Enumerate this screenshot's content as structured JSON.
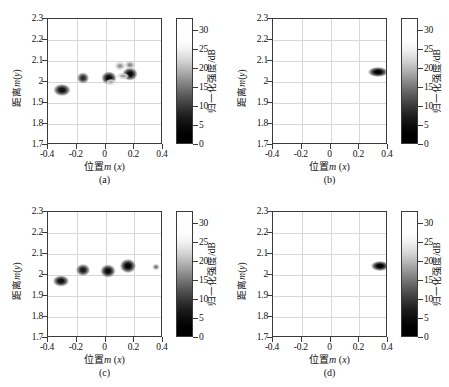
{
  "figure": {
    "panels": [
      {
        "tag": "(a)",
        "xlabel_cn": "位置",
        "xlabel_m": "m",
        "xlabel_var": "(x)",
        "ylabel": "距离m(y)",
        "cbar_label": "归一化强度/dB"
      },
      {
        "tag": "(b)",
        "xlabel_cn": "位置",
        "xlabel_m": "m",
        "xlabel_var": "(x)",
        "ylabel": "距离m(y)",
        "cbar_label": "归一化强度/dB"
      },
      {
        "tag": "(c)",
        "xlabel_cn": "位置",
        "xlabel_m": "m",
        "xlabel_var": "(x)",
        "ylabel": "距离m(y)",
        "cbar_label": "归一化强度/dB"
      },
      {
        "tag": "(d)",
        "xlabel_cn": "位置",
        "xlabel_m": "m",
        "xlabel_var": "(x)",
        "ylabel": "距离m(y)",
        "cbar_label": "归一化强度/dB"
      }
    ]
  },
  "chart_data": [
    {
      "type": "heatmap",
      "title": "(a)",
      "xlabel": "位置m (x)",
      "ylabel": "距离m(y)",
      "xlim": [
        -0.4,
        0.4
      ],
      "ylim": [
        1.7,
        2.3
      ],
      "xticks": [
        -0.4,
        -0.2,
        0,
        0.2,
        0.4
      ],
      "xticklabels": [
        "-0.4",
        "-0.2",
        "0",
        "0.2",
        "0.4"
      ],
      "yticks": [
        1.7,
        1.8,
        1.9,
        2.0,
        2.1,
        2.2,
        2.3
      ],
      "yticklabels": [
        "1.7",
        "1.8",
        "1.9",
        "2",
        "2.1",
        "2.2",
        "2.3"
      ],
      "grid": true,
      "colorbar": {
        "label": "归一化强度/dB",
        "ticks": [
          0,
          5,
          10,
          15,
          20,
          25,
          30
        ],
        "ticklabels": [
          "0",
          "5",
          "10",
          "15",
          "20",
          "25",
          "30"
        ],
        "range": [
          0,
          33
        ],
        "colormap": "gray-inverted-top-white-bottom-black"
      },
      "points": [
        {
          "x": -0.305,
          "y": 1.962,
          "intensity": 30,
          "rx": 8.5,
          "ry": 6.0
        },
        {
          "x": -0.155,
          "y": 2.018,
          "intensity": 25,
          "rx": 6.0,
          "ry": 5.5
        },
        {
          "x": 0.022,
          "y": 2.018,
          "intensity": 31,
          "rx": 7.5,
          "ry": 6.5
        },
        {
          "x": 0.172,
          "y": 2.037,
          "intensity": 31,
          "rx": 7.5,
          "ry": 6.5
        },
        {
          "x": 0.098,
          "y": 2.078,
          "intensity": 10,
          "rx": 5.0,
          "ry": 4.0
        },
        {
          "x": 0.172,
          "y": 2.081,
          "intensity": 11,
          "rx": 5.0,
          "ry": 4.0
        },
        {
          "x": 0.12,
          "y": 2.028,
          "intensity": 8,
          "rx": 6.0,
          "ry": 3.0
        },
        {
          "x": 0.04,
          "y": 2.002,
          "intensity": 7,
          "rx": 5.0,
          "ry": 3.0
        }
      ]
    },
    {
      "type": "heatmap",
      "title": "(b)",
      "xlabel": "位置m (x)",
      "ylabel": "距离m(y)",
      "xlim": [
        -0.4,
        0.4
      ],
      "ylim": [
        1.7,
        2.3
      ],
      "xticks": [
        -0.4,
        -0.2,
        0,
        0.2,
        0.4
      ],
      "xticklabels": [
        "-0.4",
        "-0.2",
        "0",
        "0.2",
        "0.4"
      ],
      "yticks": [
        1.7,
        1.8,
        1.9,
        2.0,
        2.1,
        2.2,
        2.3
      ],
      "yticklabels": [
        "1.7",
        "1.8",
        "1.9",
        "2",
        "2.1",
        "2.2",
        "2.3"
      ],
      "grid": true,
      "colorbar": {
        "label": "归一化强度/dB",
        "ticks": [
          0,
          5,
          10,
          15,
          20,
          25,
          30
        ],
        "ticklabels": [
          "0",
          "5",
          "10",
          "15",
          "20",
          "25",
          "30"
        ],
        "range": [
          0,
          33
        ],
        "colormap": "gray-inverted-top-white-bottom-black"
      },
      "points": [
        {
          "x": 0.33,
          "y": 2.05,
          "intensity": 33,
          "rx": 10.0,
          "ry": 5.0
        }
      ]
    },
    {
      "type": "heatmap",
      "title": "(c)",
      "xlabel": "位置m (x)",
      "ylabel": "距离m(y)",
      "xlim": [
        -0.4,
        0.4
      ],
      "ylim": [
        1.7,
        2.3
      ],
      "xticks": [
        -0.4,
        -0.2,
        0,
        0.2,
        0.4
      ],
      "xticklabels": [
        "-0.4",
        "-0.2",
        "0",
        "0.2",
        "0.4"
      ],
      "yticks": [
        1.7,
        1.8,
        1.9,
        2.0,
        2.1,
        2.2,
        2.3
      ],
      "yticklabels": [
        "1.7",
        "1.8",
        "1.9",
        "2",
        "2.1",
        "2.2",
        "2.3"
      ],
      "grid": true,
      "colorbar": {
        "label": "归一化强度/dB",
        "ticks": [
          0,
          5,
          10,
          15,
          20,
          25,
          30
        ],
        "ticklabels": [
          "0",
          "5",
          "10",
          "15",
          "20",
          "25",
          "30"
        ],
        "range": [
          0,
          33
        ],
        "colormap": "gray-inverted-top-white-bottom-black"
      },
      "points": [
        {
          "x": -0.308,
          "y": 1.97,
          "intensity": 30,
          "rx": 8.0,
          "ry": 5.5
        },
        {
          "x": -0.158,
          "y": 2.022,
          "intensity": 28,
          "rx": 7.0,
          "ry": 6.0
        },
        {
          "x": 0.018,
          "y": 2.018,
          "intensity": 31,
          "rx": 7.5,
          "ry": 6.5
        },
        {
          "x": 0.158,
          "y": 2.043,
          "intensity": 32,
          "rx": 8.0,
          "ry": 7.0
        },
        {
          "x": 0.352,
          "y": 2.04,
          "intensity": 14,
          "rx": 3.5,
          "ry": 3.0
        }
      ]
    },
    {
      "type": "heatmap",
      "title": "(d)",
      "xlabel": "位置m (x)",
      "ylabel": "距离m(y)",
      "xlim": [
        -0.4,
        0.4
      ],
      "ylim": [
        1.7,
        2.3
      ],
      "xticks": [
        -0.4,
        -0.2,
        0,
        0.2,
        0.4
      ],
      "xticklabels": [
        "-0.4",
        "-0.2",
        "0",
        "0.2",
        "0.4"
      ],
      "yticks": [
        1.7,
        1.8,
        1.9,
        2.0,
        2.1,
        2.2,
        2.3
      ],
      "yticklabels": [
        "1.7",
        "1.8",
        "1.9",
        "2",
        "2.1",
        "2.2",
        "2.3"
      ],
      "grid": true,
      "colorbar": {
        "label": "归一化强度/dB",
        "ticks": [
          0,
          5,
          10,
          15,
          20,
          25,
          30
        ],
        "ticklabels": [
          "0",
          "5",
          "10",
          "15",
          "20",
          "25",
          "30"
        ],
        "range": [
          0,
          33
        ],
        "colormap": "gray-inverted-top-white-bottom-black"
      },
      "points": [
        {
          "x": 0.342,
          "y": 2.045,
          "intensity": 33,
          "rx": 9.0,
          "ry": 5.0
        }
      ]
    }
  ]
}
